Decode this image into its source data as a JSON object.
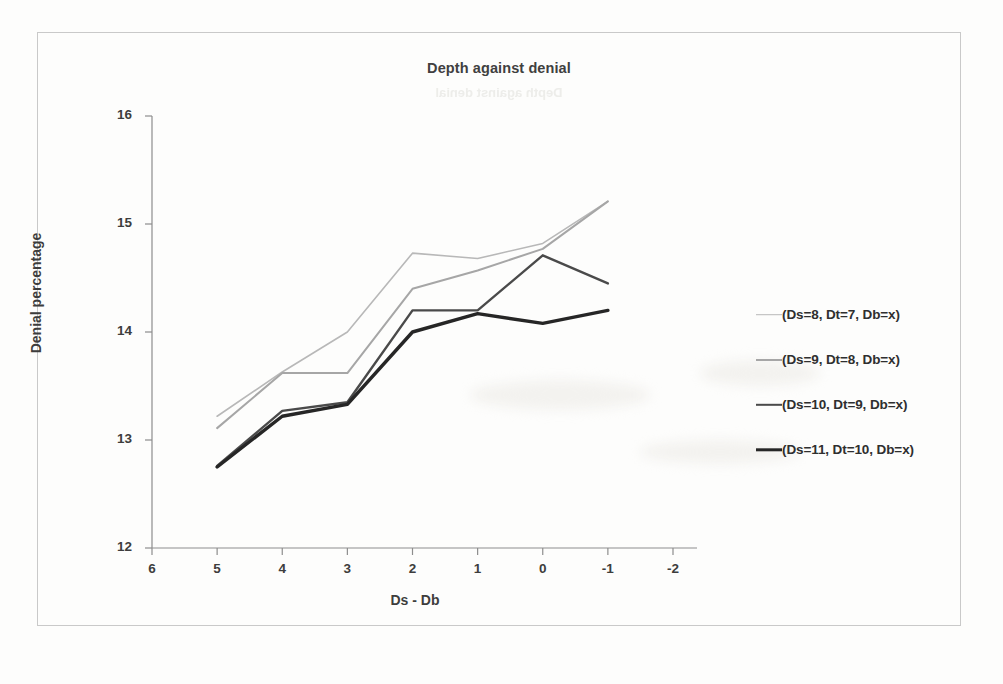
{
  "chart_data": {
    "type": "line",
    "title": "Depth against denial",
    "title_ghost": "Depth against denial",
    "xlabel": "Ds - Db",
    "ylabel": "Denial percentage",
    "x": [
      5,
      4,
      3,
      2,
      1,
      0,
      -1
    ],
    "x_ticks": [
      "6",
      "5",
      "4",
      "3",
      "2",
      "1",
      "0",
      "-1",
      "-2"
    ],
    "x_tick_values": [
      6,
      5,
      4,
      3,
      2,
      1,
      0,
      -1,
      -2
    ],
    "y_ticks": [
      "12",
      "13",
      "14",
      "15",
      "16"
    ],
    "y_tick_values": [
      12,
      13,
      14,
      15,
      16
    ],
    "xlim": [
      6,
      -2
    ],
    "ylim": [
      12,
      16
    ],
    "x_axis_reversed": true,
    "grid": false,
    "legend_position": "right",
    "series": [
      {
        "name": "(Ds=8, Dt=7, Db=x)",
        "color": "#b8b8b8",
        "width": 1.6,
        "values": [
          13.22,
          13.63,
          14.0,
          14.73,
          14.68,
          14.82,
          15.21
        ]
      },
      {
        "name": "(Ds=9, Dt=8, Db=x)",
        "color": "#a6a6a6",
        "width": 2.0,
        "values": [
          13.11,
          13.62,
          13.62,
          14.4,
          14.57,
          14.77,
          15.21
        ]
      },
      {
        "name": "(Ds=10, Dt=9, Db=x)",
        "color": "#4a4a4a",
        "width": 2.4,
        "values": [
          12.76,
          13.27,
          13.35,
          14.2,
          14.2,
          14.71,
          14.45
        ]
      },
      {
        "name": "(Ds=11, Dt=10, Db=x)",
        "color": "#262626",
        "width": 3.4,
        "values": [
          12.75,
          13.22,
          13.33,
          14.0,
          14.17,
          14.08,
          14.2
        ]
      }
    ]
  },
  "axis_color": "#8d8d8d",
  "frame_color": "#c9c9c9"
}
